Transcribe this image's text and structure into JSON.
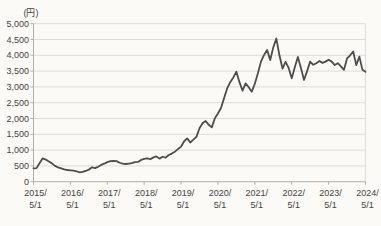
{
  "chart": {
    "unit_label": "(円)",
    "colors": {
      "line": "#4d4d4d",
      "grid": "#dcdcdc",
      "axis": "#aeaeae",
      "text": "#444444",
      "background": "#fbfaf6"
    }
  },
  "chart_data": {
    "type": "line",
    "title": "",
    "xlabel": "",
    "ylabel": "(円)",
    "ylim": [
      0,
      5000
    ],
    "ytick_step": 500,
    "ytick_labels": [
      "0",
      "500",
      "1,000",
      "1,500",
      "2,000",
      "2,500",
      "3,000",
      "3,500",
      "4,000",
      "4,500",
      "5,000"
    ],
    "xtick_labels_year": [
      "2015/",
      "2016/",
      "2017/",
      "2018/",
      "2019/",
      "2020/",
      "2021/",
      "2022/",
      "2023/",
      "2024/"
    ],
    "xtick_label_day": "5/1",
    "x_start": "2015/5/1",
    "x_end": "2024/5/1",
    "x_interval": "monthly",
    "grid": true,
    "legend": false,
    "values": [
      420,
      430,
      590,
      740,
      700,
      640,
      580,
      500,
      450,
      420,
      390,
      370,
      360,
      350,
      330,
      295,
      310,
      340,
      380,
      455,
      430,
      470,
      530,
      570,
      620,
      650,
      660,
      650,
      600,
      570,
      560,
      575,
      585,
      620,
      625,
      690,
      720,
      740,
      710,
      770,
      800,
      730,
      790,
      760,
      845,
      890,
      950,
      1030,
      1110,
      1280,
      1370,
      1240,
      1330,
      1420,
      1690,
      1850,
      1920,
      1800,
      1720,
      2010,
      2160,
      2330,
      2650,
      2950,
      3150,
      3300,
      3480,
      3150,
      2880,
      3110,
      2990,
      2850,
      3100,
      3430,
      3800,
      4010,
      4170,
      3850,
      4250,
      4530,
      4000,
      3580,
      3790,
      3600,
      3270,
      3620,
      3950,
      3600,
      3220,
      3500,
      3800,
      3700,
      3750,
      3820,
      3760,
      3800,
      3860,
      3800,
      3690,
      3750,
      3650,
      3540,
      3900,
      4000,
      4120,
      3690,
      3960,
      3540,
      3480
    ]
  }
}
